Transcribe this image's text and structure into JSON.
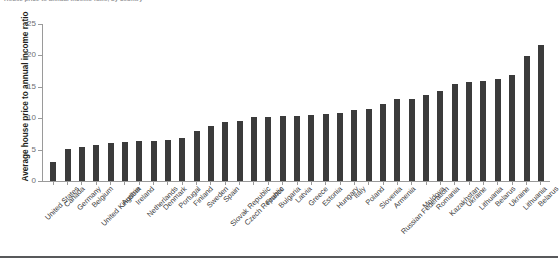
{
  "figure": {
    "title": "House price to annual income ratio, by country",
    "bar_color": "#3b3b3b",
    "axis_color": "#9a9a9a",
    "tick_label_color": "#6d6e71"
  },
  "chart_data": {
    "type": "bar",
    "title": "House price to annual income ratio, by country",
    "xlabel": "",
    "ylabel": "Average house price to annual income ratio",
    "ylim": [
      0,
      25
    ],
    "yticks": [
      0,
      5,
      10,
      15,
      20,
      25
    ],
    "grid": false,
    "legend": "none",
    "categories": [
      "United States",
      "Canada",
      "Germany",
      "Belgium",
      "United Kingdom",
      "Austria",
      "Ireland",
      "Netherlands",
      "Denmark",
      "Portugal",
      "Finland",
      "Sweden",
      "Spain",
      "Slovak Republic",
      "Czech Republic",
      "France",
      "Bulgaria",
      "Latvia",
      "Greece",
      "Estonia",
      "Hungary",
      "Italy",
      "Poland",
      "Slovenia",
      "Armenia",
      "Russian Federation",
      "Moldova",
      "Romania",
      "Kazakhstan",
      "Ukraine",
      "Lithuania",
      "Belarus"
    ],
    "values": [
      3.0,
      5.1,
      5.4,
      5.8,
      6.0,
      6.2,
      6.4,
      6.4,
      6.6,
      6.8,
      8.0,
      8.7,
      9.4,
      9.6,
      10.2,
      10.2,
      10.3,
      10.4,
      10.5,
      10.7,
      10.9,
      11.3,
      11.4,
      12.2,
      13.0,
      13.1,
      13.7,
      14.3,
      15.4,
      15.8,
      16.0,
      16.2
    ],
    "extra_categories": [
      "Ukraine",
      "Lithuania",
      "Belarus"
    ],
    "extra_values": [
      16.9,
      19.9,
      21.6
    ]
  }
}
